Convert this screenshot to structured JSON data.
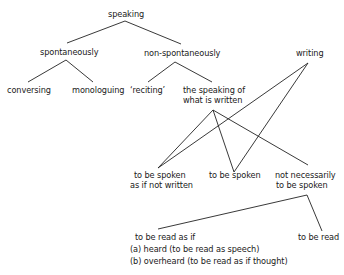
{
  "diagram": {
    "nodes": {
      "speaking": "speaking",
      "spontaneously": "spontaneously",
      "non_spontaneously": "non-spontaneously",
      "writing": "writing",
      "conversing": "conversing",
      "monologuing": "monologuing",
      "reciting": "‘reciting’",
      "speaking_of_written_1": "the speaking of",
      "speaking_of_written_2": "what is written",
      "spoken_as_if_1": "to be spoken",
      "spoken_as_if_2": "as if not written",
      "to_be_spoken": "to be spoken",
      "not_necessarily_1": "not necessarily",
      "not_necessarily_2": "to be spoken",
      "read_as_if_1": "to be read as if",
      "read_as_if_2": "(a) heard  (to be read as speech)",
      "read_as_if_3": "(b) overheard  (to be read as if thought)",
      "to_be_read": "to be read"
    },
    "edges": [
      [
        "speaking",
        "spontaneously"
      ],
      [
        "speaking",
        "non-spontaneously"
      ],
      [
        "spontaneously",
        "conversing"
      ],
      [
        "spontaneously",
        "monologuing"
      ],
      [
        "non-spontaneously",
        "reciting"
      ],
      [
        "non-spontaneously",
        "the speaking of what is written"
      ],
      [
        "the speaking of what is written",
        "to be spoken as if not written"
      ],
      [
        "the speaking of what is written",
        "to be spoken"
      ],
      [
        "the speaking of what is written",
        "not necessarily to be spoken"
      ],
      [
        "writing",
        "to be spoken as if not written"
      ],
      [
        "writing",
        "to be spoken"
      ],
      [
        "not necessarily to be spoken",
        "to be read as if"
      ],
      [
        "not necessarily to be spoken",
        "to be read"
      ]
    ]
  }
}
